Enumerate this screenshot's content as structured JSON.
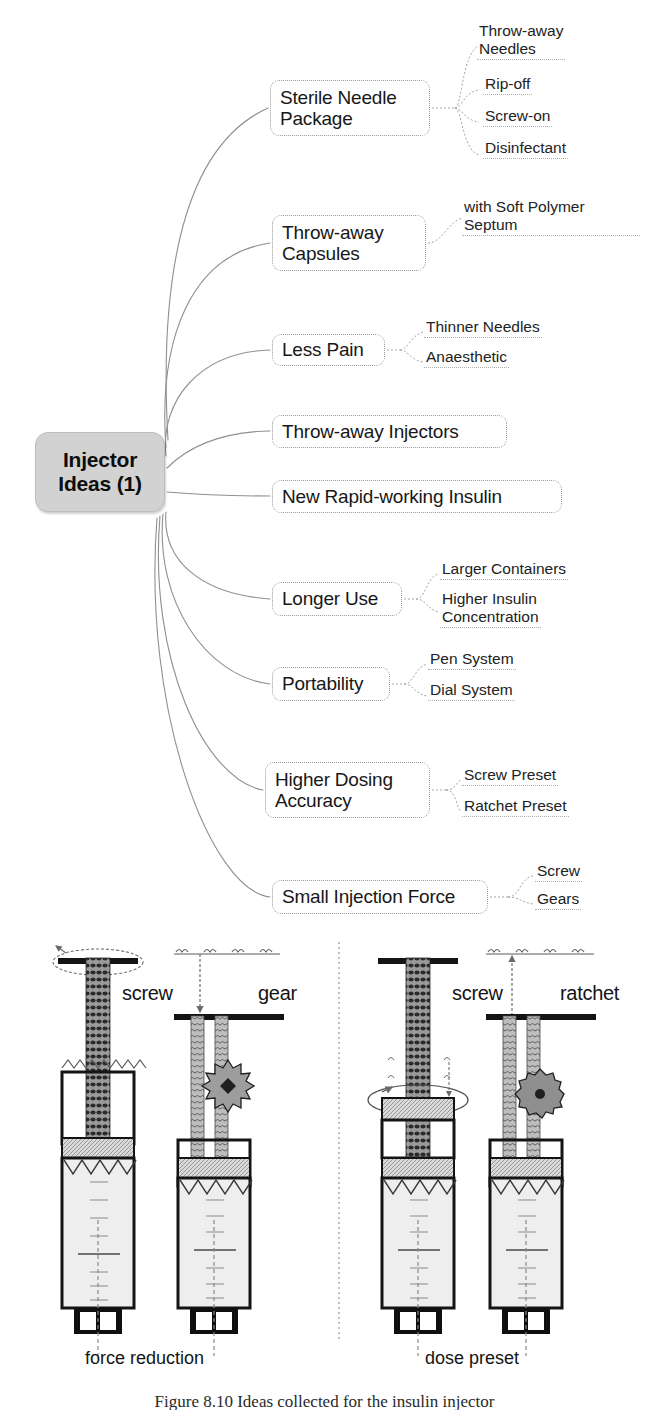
{
  "figure": {
    "caption": "Figure 8.10  Ideas collected for the insulin injector",
    "center_node": "Injector\nIdeas (1)"
  },
  "colors": {
    "center_fill": "#d2d2d2",
    "node_border": "#9a9a9a",
    "branch_line": "#8c8c8c",
    "ink": "#171717",
    "barrel_fill": "#ececec",
    "plunger_fill": "#c9c9c9"
  },
  "mindmap": {
    "branches": [
      {
        "label": "Sterile Needle\nPackage",
        "x": 270,
        "y": 80,
        "w": 160,
        "h": 56,
        "leaves": [
          {
            "text": "Throw-away\nNeedles",
            "x": 477,
            "y": 22
          },
          {
            "text": "Rip-off",
            "x": 483,
            "y": 75
          },
          {
            "text": "Screw-on",
            "x": 483,
            "y": 107
          },
          {
            "text": "Disinfectant",
            "x": 483,
            "y": 139
          }
        ]
      },
      {
        "label": "Throw-away\nCapsules",
        "x": 272,
        "y": 215,
        "w": 154,
        "h": 56,
        "leaves": [
          {
            "text": "with Soft Polymer\nSeptum",
            "x": 462,
            "y": 198
          }
        ]
      },
      {
        "label": "Less Pain",
        "x": 272,
        "y": 334,
        "w": 113,
        "h": 32,
        "leaves": [
          {
            "text": "Thinner Needles",
            "x": 424,
            "y": 318
          },
          {
            "text": "Anaesthetic",
            "x": 424,
            "y": 348
          }
        ]
      },
      {
        "label": "Throw-away Injectors",
        "x": 272,
        "y": 415,
        "w": 235,
        "h": 33,
        "leaves": []
      },
      {
        "label": "New Rapid-working Insulin",
        "x": 272,
        "y": 480,
        "w": 290,
        "h": 33,
        "leaves": []
      },
      {
        "label": "Longer Use",
        "x": 272,
        "y": 582,
        "w": 130,
        "h": 34,
        "leaves": [
          {
            "text": "Larger Containers",
            "x": 440,
            "y": 560
          },
          {
            "text": "Higher Insulin\nConcentration",
            "x": 440,
            "y": 590
          }
        ]
      },
      {
        "label": "Portability",
        "x": 272,
        "y": 667,
        "w": 118,
        "h": 34,
        "leaves": [
          {
            "text": "Pen System",
            "x": 428,
            "y": 650
          },
          {
            "text": "Dial System",
            "x": 428,
            "y": 681
          }
        ]
      },
      {
        "label": "Higher Dosing\nAccuracy",
        "x": 265,
        "y": 762,
        "w": 165,
        "h": 56,
        "leaves": [
          {
            "text": "Screw Preset",
            "x": 462,
            "y": 766
          },
          {
            "text": "Ratchet Preset",
            "x": 462,
            "y": 797
          }
        ]
      },
      {
        "label": "Small Injection Force",
        "x": 272,
        "y": 880,
        "w": 216,
        "h": 34,
        "leaves": [
          {
            "text": "Screw",
            "x": 535,
            "y": 862
          },
          {
            "text": "Gears",
            "x": 535,
            "y": 890
          }
        ]
      }
    ],
    "center": {
      "x": 35,
      "y": 432,
      "w": 130,
      "h": 80
    }
  },
  "illustration": {
    "parts": [
      {
        "name": "screw-label-left",
        "text": "screw",
        "x": 122,
        "y": 988
      },
      {
        "name": "gear-label",
        "text": "gear",
        "x": 258,
        "y": 988
      },
      {
        "name": "screw-label-right",
        "text": "screw",
        "x": 452,
        "y": 988
      },
      {
        "name": "ratchet-label",
        "text": "ratchet",
        "x": 560,
        "y": 988
      }
    ],
    "group_captions": [
      {
        "text": "force reduction",
        "x": 85,
        "y": 1355
      },
      {
        "text": "dose preset",
        "x": 425,
        "y": 1355
      }
    ]
  }
}
